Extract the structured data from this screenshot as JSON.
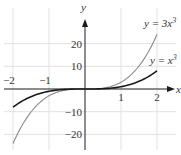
{
  "chart_data": {
    "type": "line",
    "title": "",
    "xlabel": "x",
    "ylabel": "y",
    "xlim": [
      -2,
      2
    ],
    "ylim": [
      -24,
      24
    ],
    "grid": true,
    "x_ticks": [
      -2,
      -1,
      1,
      2
    ],
    "x_tick_labels": [
      "−2",
      "−1",
      "1",
      "2"
    ],
    "y_ticks": [
      20,
      10,
      -10,
      -20
    ],
    "y_tick_labels": [
      "20",
      "10",
      "−10",
      "−20"
    ],
    "series": [
      {
        "name": "y = 3x^3",
        "label_prefix": "y = 3",
        "label_var": "x",
        "label_exp": "3",
        "color": "#8a8a8a",
        "x": [
          -2,
          -1.5,
          -1,
          -0.5,
          0,
          0.5,
          1,
          1.5,
          2
        ],
        "values": [
          -24,
          -10.125,
          -3,
          -0.375,
          0,
          0.375,
          3,
          10.125,
          24
        ]
      },
      {
        "name": "y = x^3",
        "label_prefix": "y = ",
        "label_var": "x",
        "label_exp": "3",
        "color": "#1a1a1a",
        "x": [
          -2,
          -1.5,
          -1,
          -0.5,
          0,
          0.5,
          1,
          1.5,
          2
        ],
        "values": [
          -8,
          -3.375,
          -1,
          -0.125,
          0,
          0.125,
          1,
          3.375,
          8
        ]
      }
    ],
    "legend_position": "inline labels near right ends of curves"
  },
  "colors": {
    "grid": "#e2e2e2",
    "axis": "#1a1a1a",
    "curve_steep": "#8a8a8a",
    "curve_base": "#1a1a1a"
  }
}
